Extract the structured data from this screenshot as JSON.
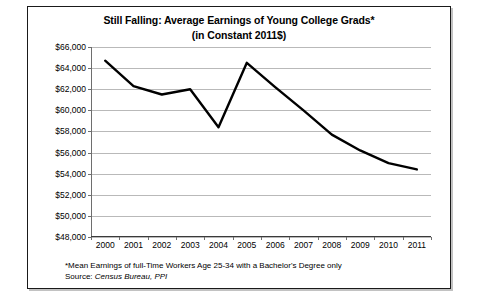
{
  "chart_data": {
    "type": "line",
    "title": "Still Falling: Average Earnings of Young College Grads*",
    "subtitle": "(in Constant 2011$)",
    "xlabel": "",
    "ylabel": "",
    "categories": [
      "2000",
      "2001",
      "2002",
      "2003",
      "2004",
      "2005",
      "2006",
      "2007",
      "2008",
      "2009",
      "2010",
      "2011"
    ],
    "values": [
      64700,
      62300,
      61500,
      62000,
      58400,
      64500,
      62200,
      60000,
      57700,
      56200,
      55000,
      54400
    ],
    "ylim": [
      48000,
      66000
    ],
    "ytick_values": [
      48000,
      50000,
      52000,
      54000,
      56000,
      58000,
      60000,
      62000,
      64000,
      66000
    ],
    "ytick_labels": [
      "$48,000",
      "$50,000",
      "$52,000",
      "$54,000",
      "$56,000",
      "$58,000",
      "$60,000",
      "$62,000",
      "$64,000",
      "$66,000"
    ],
    "grid": true,
    "legend": false,
    "line_color": "#000000",
    "grid_color": "#b9b9b9",
    "background": "#ffffff"
  },
  "footnotes": {
    "note": "*Mean Earnings of full-Time Workers Age 25-34 with a Bachelor's Degree only",
    "source_label": "Source: ",
    "source_value": "Census Bureau, PPI"
  }
}
